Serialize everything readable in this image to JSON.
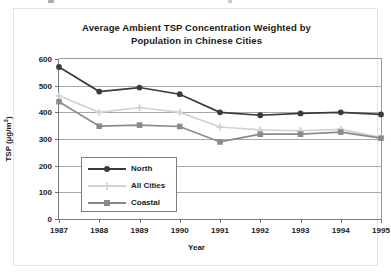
{
  "chart_data": {
    "type": "line",
    "title": "Average Ambient TSP Concentration Weighted by Population in Chinese Cities",
    "title_line1": "Average Ambient TSP Concentration Weighted by",
    "title_line2": "Population in Chinese Cities",
    "xlabel": "Year",
    "ylabel": "TSP (µg/m³)",
    "ylabel_main": "TSP (µg/m",
    "ylabel_sup": "3",
    "ylabel_close": ")",
    "categories": [
      "1987",
      "1988",
      "1989",
      "1990",
      "1991",
      "1992",
      "1993",
      "1994",
      "1995"
    ],
    "x": [
      1987,
      1988,
      1989,
      1990,
      1991,
      1992,
      1993,
      1994,
      1995
    ],
    "ylim": [
      0,
      600
    ],
    "yticks": [
      0,
      100,
      200,
      300,
      400,
      500,
      600
    ],
    "ytick_labels": [
      "0",
      "100",
      "200",
      "300",
      "400",
      "500",
      "600"
    ],
    "grid": true,
    "legend_position": "lower-left-inside",
    "series": [
      {
        "name": "North",
        "marker": "circle",
        "color": "#3b3b3b",
        "values": [
          570,
          478,
          493,
          468,
          400,
          389,
          396,
          400,
          392
        ]
      },
      {
        "name": "All Cities",
        "marker": "plus",
        "color": "#d2d2d2",
        "values": [
          462,
          400,
          418,
          400,
          345,
          334,
          331,
          336,
          306
        ]
      },
      {
        "name": "Coastal",
        "marker": "square",
        "color": "#8a8a8a",
        "values": [
          440,
          348,
          352,
          347,
          289,
          318,
          318,
          326,
          303
        ]
      }
    ]
  },
  "legend": {
    "items": [
      {
        "label": "North"
      },
      {
        "label": "All Cities"
      },
      {
        "label": "Coastal"
      }
    ]
  }
}
